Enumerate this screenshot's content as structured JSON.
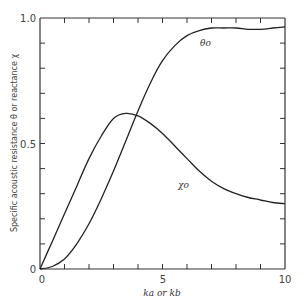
{
  "chart_data": {
    "type": "line",
    "title": "",
    "xlabel": "ka or kb",
    "ylabel": "Specific acoustic resistance θ or reactance χ",
    "xlim": [
      0,
      10
    ],
    "ylim": [
      0,
      1.0
    ],
    "x_ticks": [
      0,
      1,
      2,
      3,
      4,
      5,
      6,
      7,
      8,
      9,
      10
    ],
    "x_tick_labels": [
      {
        "value": 0,
        "label": "0"
      },
      {
        "value": 5,
        "label": "5"
      },
      {
        "value": 10,
        "label": "10"
      }
    ],
    "y_ticks": [
      0,
      0.1,
      0.2,
      0.3,
      0.4,
      0.5,
      0.6,
      0.7,
      0.8,
      0.9,
      1.0
    ],
    "y_tick_labels": [
      {
        "value": 0,
        "label": "0"
      },
      {
        "value": 0.5,
        "label": "0.5"
      },
      {
        "value": 1.0,
        "label": "1.0"
      }
    ],
    "grid": false,
    "legend": "inline curve labels",
    "series": [
      {
        "name": "θ₀",
        "label": "θo",
        "x": [
          0,
          0.5,
          1.0,
          1.5,
          2.0,
          2.5,
          3.0,
          3.5,
          4.0,
          4.5,
          5.0,
          5.5,
          6.0,
          6.5,
          7.0,
          7.5,
          8.0,
          8.5,
          9.0,
          9.5,
          10.0
        ],
        "values": [
          0,
          0.01,
          0.04,
          0.1,
          0.18,
          0.28,
          0.39,
          0.51,
          0.63,
          0.74,
          0.83,
          0.89,
          0.93,
          0.95,
          0.96,
          0.96,
          0.96,
          0.955,
          0.955,
          0.96,
          0.965
        ]
      },
      {
        "name": "χ₀",
        "label": "χo",
        "x": [
          0,
          0.5,
          1.0,
          1.5,
          2.0,
          2.5,
          3.0,
          3.5,
          4.0,
          4.5,
          5.0,
          5.5,
          6.0,
          6.5,
          7.0,
          7.5,
          8.0,
          8.5,
          9.0,
          9.5,
          10.0
        ],
        "values": [
          0,
          0.11,
          0.22,
          0.33,
          0.44,
          0.53,
          0.6,
          0.62,
          0.61,
          0.58,
          0.54,
          0.49,
          0.44,
          0.39,
          0.35,
          0.32,
          0.3,
          0.285,
          0.275,
          0.265,
          0.26
        ]
      }
    ]
  },
  "labels": {
    "y_axis": "Specific acoustic resistance θ or reactance χ",
    "x_axis": "ka or kb",
    "x_tick_0": "0",
    "x_tick_5": "5",
    "x_tick_10": "10",
    "y_tick_0": "0",
    "y_tick_05": "0.5",
    "y_tick_10": "1.0",
    "theta_label": "θo",
    "chi_label": "χo"
  }
}
